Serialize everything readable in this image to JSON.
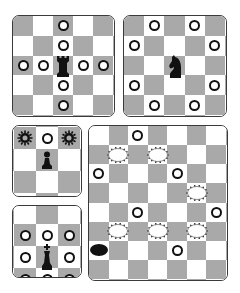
{
  "colors": {
    "dark_square": "#a9a9a9",
    "light_square": "#ffffff",
    "border": "#3a3a3a",
    "piece": "#111111"
  },
  "boards": [
    {
      "name": "rook-moves",
      "piece": "rook",
      "x": 12,
      "y": 15,
      "w": 103,
      "h": 102,
      "cols": 5,
      "rows": 5,
      "offset_x": 0,
      "offset_y": 0,
      "first_dark": true,
      "piece_pos": [
        2,
        2
      ],
      "dots": [
        [
          2,
          0
        ],
        [
          2,
          1
        ],
        [
          0,
          2
        ],
        [
          1,
          2
        ],
        [
          3,
          2
        ],
        [
          4,
          2
        ],
        [
          2,
          3
        ],
        [
          2,
          4
        ]
      ],
      "sunbursts": [],
      "ovals": [],
      "black_ovals": []
    },
    {
      "name": "knight-moves",
      "piece": "knight",
      "x": 123,
      "y": 15,
      "w": 104,
      "h": 102,
      "cols": 5,
      "rows": 5,
      "offset_x": 0,
      "offset_y": 0,
      "first_dark": true,
      "piece_pos": [
        2,
        2
      ],
      "dots": [
        [
          1,
          0
        ],
        [
          3,
          0
        ],
        [
          0,
          1
        ],
        [
          4,
          1
        ],
        [
          0,
          3
        ],
        [
          4,
          3
        ],
        [
          1,
          4
        ],
        [
          3,
          4
        ]
      ],
      "sunbursts": [],
      "ovals": [],
      "black_ovals": []
    },
    {
      "name": "pawn-moves",
      "piece": "pawn",
      "x": 12,
      "y": 125,
      "w": 70,
      "h": 72,
      "cols": 3,
      "rows": 3,
      "offset_x": 1,
      "offset_y": -13,
      "cell": 22,
      "first_dark": true,
      "piece_pos": [
        1,
        1
      ],
      "dots": [
        [
          1,
          0
        ]
      ],
      "sunbursts": [
        [
          0,
          0
        ],
        [
          2,
          0
        ]
      ],
      "ovals": [],
      "black_ovals": []
    },
    {
      "name": "king-moves",
      "piece": "king",
      "x": 12,
      "y": 205,
      "w": 70,
      "h": 73,
      "cols": 3,
      "rows": 3,
      "offset_x": 1,
      "offset_y": 4,
      "cell": 22,
      "first_dark": true,
      "piece_pos": [
        1,
        1
      ],
      "dots": [
        [
          0,
          0
        ],
        [
          1,
          0
        ],
        [
          2,
          0
        ],
        [
          0,
          1
        ],
        [
          2,
          1
        ],
        [
          0,
          2
        ],
        [
          1,
          2
        ],
        [
          2,
          2
        ]
      ],
      "sunbursts": [],
      "ovals": [],
      "black_ovals": []
    },
    {
      "name": "checkers-board",
      "piece": "",
      "x": 88,
      "y": 125,
      "w": 140,
      "h": 156,
      "cols": 7,
      "rows": 8,
      "offset_x": 0,
      "offset_y": 0,
      "first_dark": false,
      "piece_pos": null,
      "dots": [
        [
          2,
          0
        ],
        [
          0,
          2
        ],
        [
          4,
          2
        ],
        [
          2,
          4
        ],
        [
          6,
          4
        ],
        [
          4,
          6
        ]
      ],
      "sunbursts": [],
      "ovals": [
        [
          1,
          1
        ],
        [
          3,
          1
        ],
        [
          5,
          3
        ],
        [
          1,
          5
        ],
        [
          3,
          5
        ],
        [
          5,
          5
        ]
      ],
      "black_ovals": [
        [
          0,
          6
        ]
      ]
    }
  ]
}
